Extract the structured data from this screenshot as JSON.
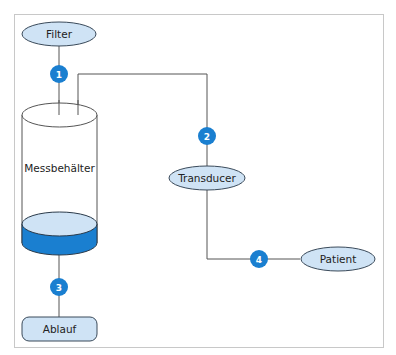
{
  "diagram": {
    "title": "",
    "colors": {
      "node_fill": "#cfe3f5",
      "node_stroke": "#3a4a5a",
      "badge_fill": "#1a7fd0",
      "liquid_fill": "#1a7fd0",
      "liquid_top": "#cfe3f5",
      "line": "#555555",
      "frame": "#c8c8c8"
    },
    "nodes": {
      "filter": "Filter",
      "container": "Messbehälter",
      "transducer": "Transducer",
      "patient": "Patient",
      "drain": "Ablauf"
    },
    "badges": {
      "b1": "1",
      "b2": "2",
      "b3": "3",
      "b4": "4"
    },
    "edges": [
      {
        "from": "Filter",
        "to": "Messbehälter",
        "badge": "1"
      },
      {
        "from": "Messbehälter",
        "to": "Transducer",
        "badge": "2"
      },
      {
        "from": "Messbehälter",
        "to": "Ablauf",
        "badge": "3"
      },
      {
        "from": "Transducer",
        "to": "Patient",
        "badge": "4"
      }
    ]
  }
}
